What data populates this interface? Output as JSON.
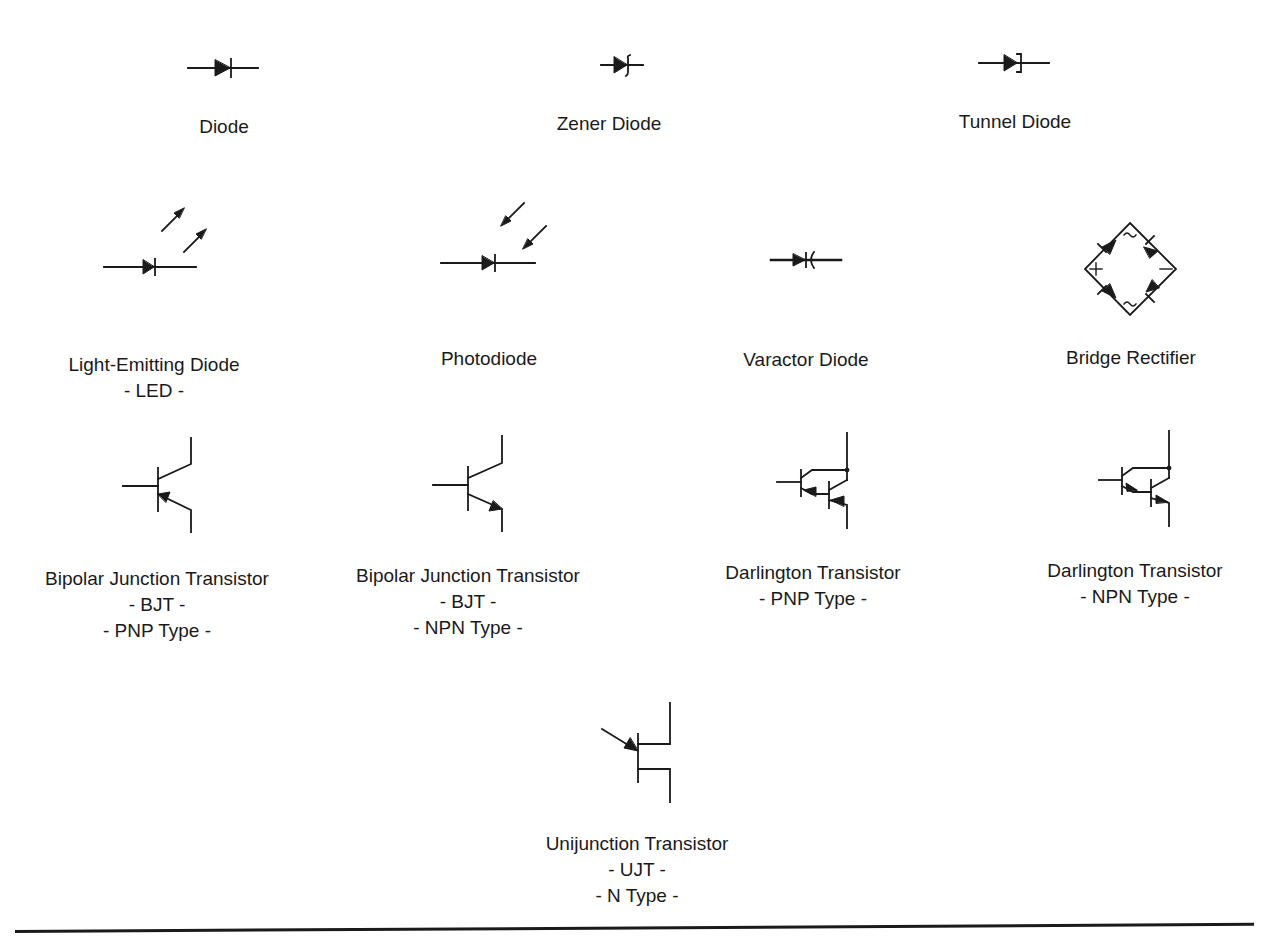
{
  "components": [
    {
      "id": "diode",
      "lines": [
        "Diode"
      ]
    },
    {
      "id": "zener-diode",
      "lines": [
        "Zener Diode"
      ]
    },
    {
      "id": "tunnel-diode",
      "lines": [
        "Tunnel Diode"
      ]
    },
    {
      "id": "led",
      "lines": [
        "Light-Emitting Diode",
        "- LED -"
      ]
    },
    {
      "id": "photodiode",
      "lines": [
        "Photodiode"
      ]
    },
    {
      "id": "varactor-diode",
      "lines": [
        "Varactor Diode"
      ]
    },
    {
      "id": "bridge-rectifier",
      "lines": [
        "Bridge Rectifier"
      ],
      "marks": {
        "plus": "+",
        "minus": "−",
        "ac_top": "~",
        "ac_bottom": "~"
      }
    },
    {
      "id": "bjt-pnp",
      "lines": [
        "Bipolar Junction Transistor",
        "- BJT -",
        "- PNP Type -"
      ]
    },
    {
      "id": "bjt-npn",
      "lines": [
        "Bipolar Junction Transistor",
        "- BJT -",
        "- NPN Type -"
      ]
    },
    {
      "id": "darlington-pnp",
      "lines": [
        "Darlington Transistor",
        "- PNP Type -"
      ]
    },
    {
      "id": "darlington-npn",
      "lines": [
        "Darlington Transistor",
        "- NPN Type -"
      ]
    },
    {
      "id": "ujt-n",
      "lines": [
        "Unijunction Transistor",
        "- UJT -",
        "- N Type -"
      ]
    }
  ],
  "colors": {
    "ink": "#1a1a1a",
    "background": "#ffffff"
  }
}
